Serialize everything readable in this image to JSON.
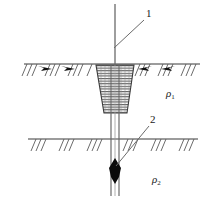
{
  "figure": {
    "background_color": "#ffffff",
    "line_color": "#3a3a3a",
    "fill_color": "#000000",
    "width": 212,
    "height": 207
  },
  "callouts": [
    {
      "id": "callout-1",
      "label": "1",
      "label_x": 146,
      "label_y": 8,
      "leader": {
        "x1": 114,
        "y1": 48,
        "x2": 144,
        "y2": 20
      },
      "refers_to": "drill-rod"
    },
    {
      "id": "callout-2",
      "label": "2",
      "label_x": 150,
      "label_y": 114,
      "leader": {
        "x1": 116,
        "y1": 166,
        "x2": 149,
        "y2": 126
      },
      "refers_to": "drill-bit"
    }
  ],
  "layers": [
    {
      "id": "layer-upper",
      "resistivity_symbol": "ρ",
      "subscript": "1",
      "label_x": 166,
      "label_y": 88
    },
    {
      "id": "layer-lower",
      "resistivity_symbol": "ρ",
      "subscript": "2",
      "label_x": 152,
      "label_y": 174
    }
  ],
  "boundaries": {
    "ground_surface": {
      "name": "ground-surface-line",
      "y": 64,
      "x_start": 24,
      "x_end": 200,
      "has_arrows": true,
      "hatch_groups": 11
    },
    "layer_interface": {
      "name": "layer-interface-line",
      "y": 139,
      "x_start": 28,
      "x_end": 198,
      "has_arrows": false,
      "hatch_groups": 9
    }
  },
  "crater": {
    "name": "excavation-crater",
    "top_left_x": 96,
    "top_right_x": 134,
    "bottom_left_x": 104,
    "bottom_right_x": 127,
    "top_y": 65,
    "bottom_y": 113,
    "hatch_style": "horizontal"
  },
  "drill_rod": {
    "name": "drill-rod",
    "top_y": 4,
    "surface_y": 64,
    "bottom_y": 196,
    "center_x": 115,
    "single_line_half_width": 0,
    "pipe_half_width": 4
  },
  "drill_bit": {
    "name": "drill-bit",
    "center_x": 115,
    "top_y": 158,
    "bottom_y": 184,
    "half_width": 6,
    "shape": "lens-diamond"
  }
}
